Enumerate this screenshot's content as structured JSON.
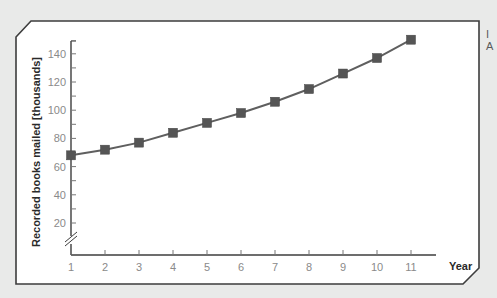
{
  "chart_data": {
    "type": "line",
    "title": "",
    "xlabel": "Year",
    "ylabel": "Recorded books mailed [thousands]",
    "categories": [
      "1",
      "2",
      "3",
      "4",
      "5",
      "6",
      "7",
      "8",
      "9",
      "10",
      "11"
    ],
    "x": [
      1,
      2,
      3,
      4,
      5,
      6,
      7,
      8,
      9,
      10,
      11
    ],
    "values": [
      68,
      72,
      77,
      84,
      91,
      98,
      106,
      115,
      126,
      137,
      150
    ],
    "series": [
      {
        "name": "Recorded books mailed",
        "values": [
          68,
          72,
          77,
          84,
          91,
          98,
          106,
          115,
          126,
          137,
          150
        ]
      }
    ],
    "yticks": [
      20,
      40,
      60,
      80,
      100,
      120,
      140
    ],
    "ylim": [
      0,
      150
    ],
    "xlim": [
      1,
      11
    ],
    "y_axis_break": true,
    "grid": false,
    "legend": "none",
    "marker": "square"
  },
  "colors": {
    "background": "#e9eae9",
    "plot_background": "#ffffff",
    "frame": "#3d3d3d",
    "line": "#5f5f5f",
    "marker": "#555555",
    "tick_label": "#8a8a8a"
  },
  "side_fragment": {
    "line1": "I",
    "line2": "A"
  }
}
